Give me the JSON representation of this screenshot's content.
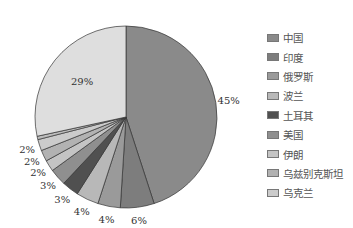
{
  "chart_data": {
    "type": "pie",
    "title": "",
    "start_angle_deg": 0,
    "direction": "clockwise",
    "slices": [
      {
        "label": "中国",
        "value": 45,
        "display": "45%",
        "color": "#8a8a8a"
      },
      {
        "label": "印度",
        "value": 6,
        "display": "6%",
        "color": "#7d7d7d"
      },
      {
        "label": "俄罗斯",
        "value": 4,
        "display": "4%",
        "color": "#9a9a9a"
      },
      {
        "label": "波兰",
        "value": 4,
        "display": "4%",
        "color": "#b8b8b8"
      },
      {
        "label": "土耳其",
        "value": 3,
        "display": "3%",
        "color": "#505050"
      },
      {
        "label": "美国",
        "value": 3,
        "display": "3%",
        "color": "#8f8f8f"
      },
      {
        "label": "伊朗",
        "value": 2,
        "display": "2%",
        "color": "#c4c4c4"
      },
      {
        "label": "乌兹别克斯坦",
        "value": 2,
        "display": "2%",
        "color": "#b2b2b2"
      },
      {
        "label": "乌克兰",
        "value": 2,
        "display": "2%",
        "color": "#cbcbcb"
      },
      {
        "label": "",
        "value": 0.6,
        "display": "",
        "color": "#bdbdbd"
      },
      {
        "label": "",
        "value": 28.4,
        "display": "29%",
        "color": "#dedede"
      }
    ],
    "legend": [
      "中国",
      "印度",
      "俄罗斯",
      "波兰",
      "土耳其",
      "美国",
      "伊朗",
      "乌兹别克斯坦",
      "乌克兰"
    ],
    "legend_position": "right"
  }
}
